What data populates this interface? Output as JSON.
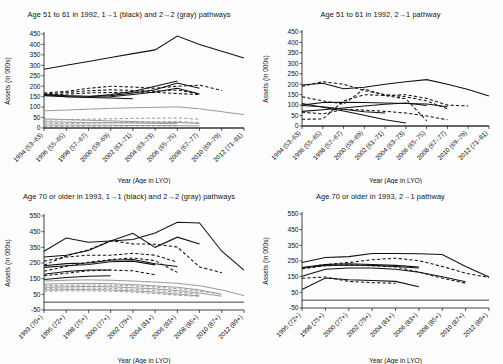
{
  "figure": {
    "axis_titles": {
      "y": "Assets (in 000s)",
      "x": "Year (Age in LYO)"
    }
  },
  "chart_data": [
    {
      "id": "top-left",
      "type": "line",
      "title": "Age 51 to 61 in 1992, 1→1 (black) and 2→2 (gray) pathways",
      "xlabel": "Year (Age in LYO)",
      "ylabel": "Assets (in 000s)",
      "ylim": [
        0,
        450
      ],
      "yticks": [
        0,
        50,
        100,
        150,
        200,
        250,
        300,
        350,
        400,
        450
      ],
      "grid": false,
      "legend": "none",
      "categories": [
        "1994 (53–63)",
        "1996 (55–65)",
        "1998 (57–67)",
        "2000 (59–69)",
        "2002 (61–71)",
        "2004 (63–73)",
        "2006 (65–75)",
        "2008 (67–77)",
        "2010 (69–79)",
        "2012 (71–81)"
      ],
      "series": [
        {
          "name": "black-solid-1",
          "color": "#111111",
          "style": "solid",
          "values": [
            281,
            300,
            318,
            337,
            356,
            374,
            440,
            400,
            368,
            335
          ]
        },
        {
          "name": "black-solid-2",
          "color": "#111111",
          "style": "solid",
          "values": [
            162,
            155,
            152,
            155,
            168,
            183,
            215,
            190,
            null,
            null
          ]
        },
        {
          "name": "black-solid-3",
          "color": "#111111",
          "style": "solid",
          "values": [
            160,
            150,
            148,
            150,
            160,
            172,
            190,
            163,
            null,
            null
          ]
        },
        {
          "name": "black-solid-4",
          "color": "#111111",
          "style": "solid",
          "values": [
            null,
            null,
            150,
            160,
            175,
            200,
            225,
            null,
            null,
            null
          ]
        },
        {
          "name": "black-solid-5",
          "color": "#111111",
          "style": "solid",
          "values": [
            155,
            150,
            146,
            144,
            140,
            null,
            null,
            null,
            null,
            null
          ]
        },
        {
          "name": "black-dash-1",
          "color": "#111111",
          "style": "dashed",
          "values": [
            168,
            175,
            190,
            200,
            196,
            190,
            200,
            205,
            180,
            null
          ]
        },
        {
          "name": "black-dash-2",
          "color": "#111111",
          "style": "dashed",
          "values": [
            163,
            170,
            178,
            183,
            180,
            176,
            182,
            163,
            null,
            null
          ]
        },
        {
          "name": "black-dash-3",
          "color": "#111111",
          "style": "dashed",
          "values": [
            158,
            162,
            168,
            170,
            172,
            170,
            165,
            160,
            null,
            null
          ]
        },
        {
          "name": "gray-solid-1",
          "color": "#9a9a9a",
          "style": "solid",
          "values": [
            82,
            86,
            90,
            94,
            97,
            99,
            101,
            92,
            78,
            64
          ]
        },
        {
          "name": "gray-solid-2",
          "color": "#9a9a9a",
          "style": "solid",
          "values": [
            44,
            40,
            37,
            34,
            31,
            28,
            26,
            22,
            null,
            null
          ]
        },
        {
          "name": "gray-solid-3",
          "color": "#9a9a9a",
          "style": "solid",
          "values": [
            30,
            28,
            26,
            25,
            24,
            22,
            20,
            null,
            null,
            null
          ]
        },
        {
          "name": "gray-solid-4",
          "color": "#9a9a9a",
          "style": "solid",
          "values": [
            14,
            14,
            13,
            13,
            12,
            12,
            11,
            10,
            null,
            null
          ]
        },
        {
          "name": "gray-dash-1",
          "color": "#9a9a9a",
          "style": "dashed",
          "values": [
            38,
            40,
            42,
            44,
            46,
            47,
            48,
            42,
            null,
            null
          ]
        },
        {
          "name": "gray-dash-2",
          "color": "#9a9a9a",
          "style": "dashed",
          "values": [
            22,
            22,
            23,
            25,
            27,
            29,
            31,
            26,
            null,
            null
          ]
        },
        {
          "name": "gray-dash-3",
          "color": "#9a9a9a",
          "style": "dashed",
          "values": [
            8,
            8,
            9,
            9,
            10,
            10,
            10,
            null,
            null,
            null
          ]
        }
      ]
    },
    {
      "id": "top-right",
      "type": "line",
      "title": "Age 51 to 61 in 1992, 2→1 pathway",
      "xlabel": "Year (Age in LYO)",
      "ylabel": "Assets (in 000s)",
      "ylim": [
        0,
        450
      ],
      "yticks": [
        0,
        50,
        100,
        150,
        200,
        250,
        300,
        350,
        400,
        450
      ],
      "grid": false,
      "legend": "none",
      "categories": [
        "1994 (53–63)",
        "1996 (55–65)",
        "1998 (57–67)",
        "2000 (59–69)",
        "2002 (61–71)",
        "2004 (63–73)",
        "2006 (65–75)",
        "2008 (67–77)",
        "2010 (69–79)",
        "2012 (71–81)"
      ],
      "series": [
        {
          "name": "black-solid-1",
          "color": "#111111",
          "style": "solid",
          "values": [
            196,
            205,
            178,
            186,
            200,
            212,
            222,
            200,
            175,
            144
          ]
        },
        {
          "name": "black-solid-2",
          "color": "#111111",
          "style": "solid",
          "values": [
            100,
            112,
            114,
            112,
            110,
            108,
            105,
            92,
            null,
            null
          ]
        },
        {
          "name": "black-solid-3",
          "color": "#111111",
          "style": "solid",
          "values": [
            108,
            90,
            72,
            52,
            30,
            14,
            null,
            null,
            null,
            null
          ]
        },
        {
          "name": "black-solid-4",
          "color": "#111111",
          "style": "solid",
          "values": [
            70,
            78,
            86,
            96,
            104,
            110,
            98,
            null,
            null,
            null
          ]
        },
        {
          "name": "black-solid-5",
          "color": "#111111",
          "style": "solid",
          "values": [
            98,
            92,
            80,
            68,
            62,
            null,
            null,
            null,
            null,
            null
          ]
        },
        {
          "name": "black-dash-1",
          "color": "#111111",
          "style": "dashed",
          "values": [
            190,
            212,
            200,
            170,
            150,
            140,
            120,
            82,
            null,
            null
          ]
        },
        {
          "name": "black-dash-2",
          "color": "#111111",
          "style": "dashed",
          "values": [
            140,
            120,
            105,
            178,
            146,
            150,
            132,
            100,
            96,
            null
          ]
        },
        {
          "name": "black-dash-3",
          "color": "#111111",
          "style": "dashed",
          "values": [
            66,
            58,
            80,
            76,
            70,
            62,
            48,
            30,
            null,
            null
          ]
        },
        {
          "name": "black-dash-4",
          "color": "#111111",
          "style": "dashed",
          "values": [
            32,
            34,
            120,
            150,
            146,
            130,
            25,
            null,
            null,
            null
          ]
        }
      ]
    },
    {
      "id": "bottom-left",
      "type": "line",
      "title": "Age 70 or older in 1993, 1→1 (black) and 2→2 (gray) pathways",
      "xlabel": "Year (Age in LYO)",
      "ylabel": "Assets (in 000s)",
      "ylim": [
        -50,
        550
      ],
      "yticks": [
        -50,
        50,
        150,
        250,
        350,
        450,
        550
      ],
      "grid": false,
      "legend": "none",
      "categories": [
        "1993 (70+)",
        "1995 (72+)",
        "1998 (75+)",
        "2000 (77+)",
        "2002 (79+)",
        "2004 (81+)",
        "2006 (83+)",
        "2008 (85+)",
        "2010 (87+)",
        "2012 (89+)"
      ],
      "series": [
        {
          "name": "black-solid-1",
          "color": "#111111",
          "style": "solid",
          "values": [
            325,
            410,
            382,
            390,
            400,
            442,
            510,
            505,
            325,
            205
          ]
        },
        {
          "name": "black-solid-2",
          "color": "#111111",
          "style": "solid",
          "values": [
            288,
            300,
            330,
            390,
            440,
            350,
            415,
            372,
            null,
            null
          ]
        },
        {
          "name": "black-solid-3",
          "color": "#111111",
          "style": "solid",
          "values": [
            232,
            246,
            250,
            268,
            272,
            245,
            228,
            null,
            null,
            null
          ]
        },
        {
          "name": "black-solid-4",
          "color": "#111111",
          "style": "solid",
          "values": [
            222,
            232,
            240,
            258,
            262,
            238,
            null,
            null,
            null,
            null
          ]
        },
        {
          "name": "black-solid-5",
          "color": "#111111",
          "style": "solid",
          "values": [
            178,
            196,
            205,
            205,
            null,
            null,
            null,
            null,
            null,
            null
          ]
        },
        {
          "name": "black-solid-6",
          "color": "#111111",
          "style": "solid",
          "values": [
            145,
            158,
            165,
            168,
            null,
            null,
            null,
            null,
            null,
            null
          ]
        },
        {
          "name": "black-dash-1",
          "color": "#111111",
          "style": "dashed",
          "values": [
            236,
            295,
            335,
            392,
            372,
            370,
            352,
            225,
            188,
            null
          ]
        },
        {
          "name": "black-dash-2",
          "color": "#111111",
          "style": "dashed",
          "values": [
            262,
            288,
            300,
            300,
            312,
            300,
            255,
            null,
            null,
            null
          ]
        },
        {
          "name": "black-dash-3",
          "color": "#111111",
          "style": "dashed",
          "values": [
            198,
            228,
            255,
            272,
            282,
            265,
            190,
            null,
            null,
            null
          ]
        },
        {
          "name": "black-dash-4",
          "color": "#111111",
          "style": "dashed",
          "values": [
            168,
            185,
            200,
            205,
            200,
            175,
            null,
            null,
            null,
            null
          ]
        },
        {
          "name": "gray-solid-1",
          "color": "#9a9a9a",
          "style": "solid",
          "values": [
            135,
            140,
            142,
            140,
            135,
            128,
            120,
            105,
            78,
            42
          ]
        },
        {
          "name": "gray-solid-2",
          "color": "#9a9a9a",
          "style": "solid",
          "values": [
            115,
            118,
            120,
            118,
            112,
            104,
            95,
            78,
            50,
            null
          ]
        },
        {
          "name": "gray-solid-3",
          "color": "#9a9a9a",
          "style": "solid",
          "values": [
            95,
            98,
            100,
            98,
            92,
            85,
            74,
            58,
            38,
            null
          ]
        },
        {
          "name": "gray-solid-4",
          "color": "#9a9a9a",
          "style": "solid",
          "values": [
            78,
            80,
            80,
            78,
            72,
            64,
            52,
            40,
            null,
            null
          ]
        },
        {
          "name": "gray-dash-1",
          "color": "#9a9a9a",
          "style": "dashed",
          "values": [
            105,
            108,
            110,
            108,
            104,
            96,
            86,
            70,
            52,
            null
          ]
        },
        {
          "name": "gray-dash-2",
          "color": "#9a9a9a",
          "style": "dashed",
          "values": [
            88,
            90,
            90,
            88,
            82,
            75,
            64,
            50,
            null,
            null
          ]
        },
        {
          "name": "gray-dash-3",
          "color": "#9a9a9a",
          "style": "dashed",
          "values": [
            70,
            72,
            72,
            70,
            64,
            55,
            44,
            38,
            null,
            null
          ]
        }
      ]
    },
    {
      "id": "bottom-right",
      "type": "line",
      "title": "Age 70 or older in 1993, 2→1 pathway",
      "xlabel": "Year (Age in LYO)",
      "ylabel": "Assets (in 000s)",
      "ylim": [
        -50,
        550
      ],
      "yticks": [
        -50,
        50,
        150,
        250,
        350,
        450,
        550
      ],
      "grid": false,
      "legend": "none",
      "categories": [
        "1995 (72+)",
        "1998 (75+)",
        "2000 (77+)",
        "2002 (79+)",
        "2004 (81+)",
        "2006 (83+)",
        "2008 (85+)",
        "2010 (87+)",
        "2012 (89+)"
      ],
      "series": [
        {
          "name": "black-solid-1",
          "color": "#111111",
          "style": "solid",
          "values": [
            240,
            272,
            278,
            298,
            298,
            296,
            292,
            215,
            148
          ]
        },
        {
          "name": "black-solid-2",
          "color": "#111111",
          "style": "solid",
          "values": [
            208,
            228,
            232,
            228,
            222,
            212,
            null,
            null,
            null
          ]
        },
        {
          "name": "black-solid-3",
          "color": "#111111",
          "style": "solid",
          "values": [
            205,
            222,
            225,
            222,
            215,
            205,
            null,
            null,
            null
          ]
        },
        {
          "name": "black-solid-4",
          "color": "#111111",
          "style": "solid",
          "values": [
            152,
            198,
            205,
            205,
            198,
            178,
            150,
            118,
            null
          ]
        },
        {
          "name": "black-solid-5",
          "color": "#111111",
          "style": "solid",
          "values": [
            68,
            142,
            130,
            125,
            120,
            85,
            null,
            null,
            null
          ]
        },
        {
          "name": "black-dash-1",
          "color": "#111111",
          "style": "dashed",
          "values": [
            205,
            228,
            240,
            258,
            268,
            252,
            215,
            172,
            145
          ]
        },
        {
          "name": "black-dash-2",
          "color": "#111111",
          "style": "dashed",
          "values": [
            200,
            220,
            224,
            220,
            212,
            180,
            140,
            108,
            null
          ]
        },
        {
          "name": "black-dash-3",
          "color": "#111111",
          "style": "dashed",
          "values": [
            140,
            148,
            120,
            112,
            108,
            null,
            null,
            null,
            null
          ]
        }
      ]
    }
  ]
}
